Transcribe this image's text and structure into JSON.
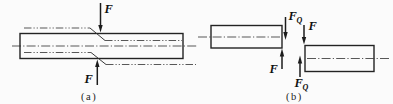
{
  "colors": {
    "background": "#fbfbfb",
    "ink": "#232323",
    "thin_line": "#3a3a3a",
    "text": "#101010"
  },
  "panel_a": {
    "caption": "(a)",
    "force_label_top": "F",
    "force_label_bottom": "F"
  },
  "panel_b": {
    "caption": "(b)",
    "shear_label_top": {
      "base": "F",
      "sub": "Q"
    },
    "force_label_top_right": "F",
    "force_label_bottom_left": "F",
    "shear_label_bottom": {
      "base": "F",
      "sub": "Q"
    }
  }
}
